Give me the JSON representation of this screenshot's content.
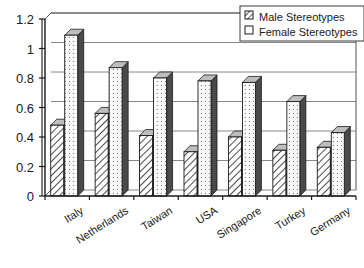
{
  "chart_data": {
    "type": "bar",
    "title": "",
    "subtitle": "",
    "xlabel": "",
    "ylabel": "",
    "categories": [
      "Italy",
      "Netherlands",
      "Taiwan",
      "USA",
      "Singapore",
      "Turkey",
      "Germany"
    ],
    "series": [
      {
        "name": "Male Stereotypes",
        "values": [
          0.48,
          0.56,
          0.41,
          0.3,
          0.4,
          0.31,
          0.33
        ]
      },
      {
        "name": "Female Stereotypes",
        "values": [
          1.09,
          0.87,
          0.8,
          0.78,
          0.77,
          0.64,
          0.43
        ]
      }
    ],
    "ylim": [
      0,
      1.2
    ],
    "yticks": [
      "0",
      "0.2",
      "0.4",
      "0.6",
      "0.8",
      "1",
      "1.2"
    ],
    "ytick_values": [
      0,
      0.2,
      0.4,
      0.6,
      0.8,
      1,
      1.2
    ],
    "grid": true,
    "grid_axis": "y",
    "legend_position": "top-right",
    "style": "3d-columns",
    "colors": {
      "male_fill": "#d8d8d8",
      "female_fill": "#f2f2f2",
      "bar_side": "#4a4a4a",
      "axis": "#1a1a1a",
      "grid": "#888888",
      "background": "#ffffff"
    }
  },
  "legend": {
    "entries": [
      {
        "label": "Male Stereotypes",
        "swatch": "hatched-swatch"
      },
      {
        "label": "Female Stereotypes",
        "swatch": "empty-swatch"
      }
    ]
  }
}
